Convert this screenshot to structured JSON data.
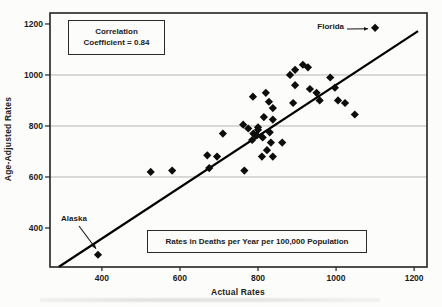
{
  "chart_data": {
    "type": "scatter",
    "title": "",
    "xlabel": "Actual Rates",
    "ylabel": "Age-Adjusted Rates",
    "xlim": [
      267,
      1233
    ],
    "ylim": [
      247,
      1243
    ],
    "x_ticks": [
      "400",
      "600",
      "800",
      "1000",
      "1200"
    ],
    "x_tick_values": [
      400,
      600,
      800,
      1000,
      1200
    ],
    "y_ticks": [
      "400",
      "600",
      "800",
      "1000",
      "1200"
    ],
    "y_tick_values": [
      400,
      600,
      800,
      1000,
      1200
    ],
    "gridlines_y": [
      600,
      800,
      1000
    ],
    "grid": "horizontal-only",
    "legend": "none",
    "marker": "diamond",
    "marker_color": "#0d0d0d",
    "trend_line": {
      "from": [
        290,
        248
      ],
      "to": [
        1210,
        1172
      ],
      "color": "#000000"
    },
    "points": [
      [
        525,
        620
      ],
      [
        580,
        625
      ],
      [
        675,
        635
      ],
      [
        670,
        685
      ],
      [
        695,
        680
      ],
      [
        710,
        770
      ],
      [
        765,
        625
      ],
      [
        762,
        805
      ],
      [
        775,
        790
      ],
      [
        788,
        770
      ],
      [
        800,
        785
      ],
      [
        812,
        755
      ],
      [
        785,
        745
      ],
      [
        797,
        763
      ],
      [
        830,
        775
      ],
      [
        833,
        735
      ],
      [
        862,
        735
      ],
      [
        823,
        705
      ],
      [
        838,
        680
      ],
      [
        810,
        680
      ],
      [
        787,
        915
      ],
      [
        820,
        930
      ],
      [
        828,
        895
      ],
      [
        838,
        870
      ],
      [
        815,
        835
      ],
      [
        838,
        825
      ],
      [
        800,
        795
      ],
      [
        882,
        1000
      ],
      [
        895,
        1020
      ],
      [
        915,
        1040
      ],
      [
        928,
        1030
      ],
      [
        895,
        960
      ],
      [
        933,
        945
      ],
      [
        950,
        930
      ],
      [
        958,
        900
      ],
      [
        890,
        890
      ],
      [
        985,
        990
      ],
      [
        997,
        950
      ],
      [
        1005,
        900
      ],
      [
        1023,
        890
      ],
      [
        1048,
        845
      ]
    ],
    "labeled_points": {
      "florida": [
        1100,
        1185
      ],
      "alaska": [
        390,
        295
      ]
    },
    "annotations": {
      "correlation_line1": "Correlation",
      "correlation_line2": "Coefficient = 0.84",
      "units_note": "Rates in Deaths per Year per 100,000 Population",
      "florida_label": "Florida",
      "alaska_label": "Alaska"
    },
    "colors": {
      "frame": "#222222",
      "gridline": "#b5b5b5",
      "text": "#1b1b1b",
      "background": "#fcfcfa"
    }
  }
}
